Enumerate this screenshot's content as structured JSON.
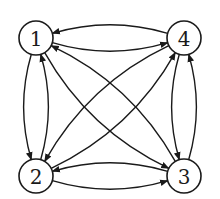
{
  "diagram": {
    "type": "directed-graph",
    "nodes": [
      {
        "id": "1",
        "label": "1",
        "x": 36,
        "y": 38
      },
      {
        "id": "4",
        "label": "4",
        "x": 184,
        "y": 38
      },
      {
        "id": "2",
        "label": "2",
        "x": 36,
        "y": 176
      },
      {
        "id": "3",
        "label": "3",
        "x": 184,
        "y": 176
      }
    ],
    "node_radius": 17,
    "edges": [
      {
        "from": "1",
        "to": "4"
      },
      {
        "from": "4",
        "to": "1"
      },
      {
        "from": "1",
        "to": "2"
      },
      {
        "from": "2",
        "to": "1"
      },
      {
        "from": "1",
        "to": "3"
      },
      {
        "from": "3",
        "to": "1"
      },
      {
        "from": "4",
        "to": "2"
      },
      {
        "from": "2",
        "to": "4"
      },
      {
        "from": "4",
        "to": "3"
      },
      {
        "from": "3",
        "to": "4"
      },
      {
        "from": "2",
        "to": "3"
      },
      {
        "from": "3",
        "to": "2"
      }
    ],
    "colors": {
      "stroke": "#1a1a1a",
      "background": "#ffffff"
    }
  }
}
